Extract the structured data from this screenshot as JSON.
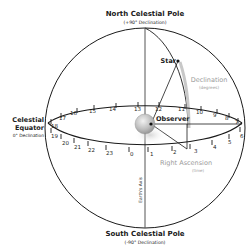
{
  "diagram": {
    "labels": {
      "north_pole": "North Celestial Pole",
      "north_pole_sub": "(+90° Declination)",
      "south_pole": "South Celestial Pole",
      "south_pole_sub": "(-90° Declination)",
      "equator_line1": "Celestial",
      "equator_line2": "Equator",
      "equator_sub": "0° Declination",
      "star": "Star",
      "observer": "Observer",
      "declination": "Declination",
      "declination_sub": "(degrees)",
      "right_ascension": "Right Ascension",
      "right_ascension_sub": "(time)",
      "earth_axis": "Earth's Axis"
    },
    "equator_hours_back": [
      "18",
      "17",
      "16",
      "15",
      "14",
      "13",
      "12",
      "11",
      "10",
      "9",
      "8",
      "7"
    ],
    "equator_hours_front": [
      "19",
      "20",
      "21",
      "22",
      "23",
      "0",
      "1",
      "2",
      "3",
      "4",
      "5",
      "6"
    ],
    "colors": {
      "line": "#1a1a1a",
      "grey_text": "#9a9a9a",
      "declination_arc": "#c8c8c8",
      "earth": "#b8b8b8"
    }
  }
}
